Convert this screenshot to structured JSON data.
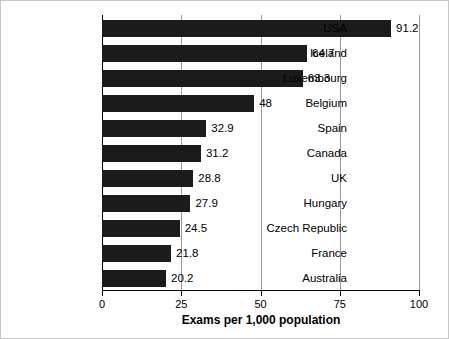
{
  "chart_data": {
    "type": "bar",
    "orientation": "horizontal",
    "title": "",
    "xlabel": "Exams per 1,000 population",
    "ylabel": "",
    "xlim": [
      0,
      100
    ],
    "xticks": [
      0,
      25,
      50,
      75,
      100
    ],
    "grid": true,
    "legend": false,
    "bar_color": "#1b1b1b",
    "categories": [
      "USA",
      "Iceland",
      "Luxembourg",
      "Belgium",
      "Spain",
      "Canada",
      "UK",
      "Hungary",
      "Czech Republic",
      "France",
      "Australia"
    ],
    "values": [
      91.2,
      64.7,
      63.3,
      48,
      32.9,
      31.2,
      28.8,
      27.9,
      24.5,
      21.8,
      20.2
    ],
    "value_labels": [
      "91.2",
      "64.7",
      "63.3",
      "48",
      "32.9",
      "31.2",
      "28.8",
      "27.9",
      "24.5",
      "21.8",
      "20.2"
    ]
  }
}
